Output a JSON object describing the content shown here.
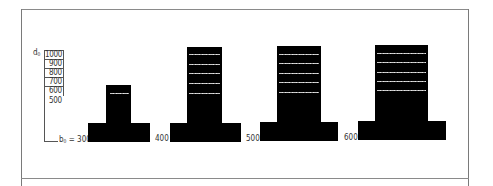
{
  "diagram": {
    "type": "footing-cross-sections",
    "axis": {
      "depth_symbol": "d",
      "depth_subscript": "0",
      "width_symbol": "b",
      "width_subscript": "0",
      "width_equals": "= 300"
    },
    "depth_scale": [
      "1000",
      "900",
      "800",
      "700",
      "600",
      "500"
    ],
    "footings": [
      {
        "width_label": "300",
        "depth_levels": [
          "600"
        ]
      },
      {
        "width_label": "400",
        "depth_levels": [
          "600",
          "700",
          "800",
          "900",
          "1000"
        ]
      },
      {
        "width_label": "500",
        "depth_levels": [
          "600",
          "700",
          "800",
          "900",
          "1000"
        ]
      },
      {
        "width_label": "600",
        "depth_levels": [
          "600",
          "700",
          "800",
          "900",
          "1000"
        ]
      }
    ],
    "colors": {
      "fill": "#000000",
      "lines": "#555555",
      "rebar": "#dddddd",
      "background": "#ffffff"
    }
  }
}
